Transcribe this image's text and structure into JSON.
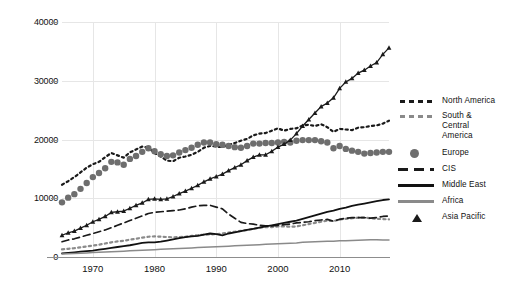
{
  "chart_data": {
    "type": "line",
    "title": "",
    "xlabel": "",
    "ylabel": "",
    "xlim": [
      1965,
      2018
    ],
    "ylim": [
      0,
      40000
    ],
    "grid": true,
    "legend_position": "right",
    "x_ticks": [
      "1970",
      "1980",
      "1990",
      "2000",
      "2010"
    ],
    "x_tick_values": [
      1970,
      1980,
      1990,
      2000,
      2010
    ],
    "y_ticks": [
      "0",
      "10000",
      "20000",
      "30000",
      "40000"
    ],
    "y_tick_values": [
      0,
      10000,
      20000,
      30000,
      40000
    ],
    "x": [
      1965,
      1966,
      1967,
      1968,
      1969,
      1970,
      1971,
      1972,
      1973,
      1974,
      1975,
      1976,
      1977,
      1978,
      1979,
      1980,
      1981,
      1982,
      1983,
      1984,
      1985,
      1986,
      1987,
      1988,
      1989,
      1990,
      1991,
      1992,
      1993,
      1994,
      1995,
      1996,
      1997,
      1998,
      1999,
      2000,
      2001,
      2002,
      2003,
      2004,
      2005,
      2006,
      2007,
      2008,
      2009,
      2010,
      2011,
      2012,
      2013,
      2014,
      2015,
      2016,
      2017,
      2018
    ],
    "series": [
      {
        "name": "North America",
        "style": "square-dotted",
        "color": "#1a1a1a",
        "values": [
          12300,
          12900,
          13600,
          14400,
          15200,
          15800,
          16200,
          17000,
          17700,
          17300,
          16900,
          17800,
          18300,
          18800,
          18600,
          17700,
          17100,
          16400,
          16300,
          16900,
          17100,
          17400,
          17900,
          18600,
          18900,
          18800,
          18700,
          19100,
          19400,
          19800,
          20100,
          20700,
          21000,
          21100,
          21500,
          21900,
          21500,
          21800,
          21900,
          22400,
          22500,
          22300,
          22600,
          22100,
          21300,
          21800,
          21700,
          21600,
          22000,
          22100,
          22300,
          22400,
          22700,
          23200
        ]
      },
      {
        "name": "South & Central America",
        "style": "square-dotted",
        "color": "#8a8a8a",
        "values": [
          1300,
          1400,
          1500,
          1650,
          1800,
          1950,
          2100,
          2300,
          2500,
          2650,
          2750,
          2950,
          3100,
          3300,
          3450,
          3500,
          3450,
          3400,
          3350,
          3400,
          3450,
          3600,
          3700,
          3800,
          3850,
          3900,
          4000,
          4150,
          4300,
          4450,
          4600,
          4800,
          5000,
          5100,
          5100,
          5200,
          5200,
          5150,
          5200,
          5400,
          5600,
          5800,
          6000,
          6200,
          6100,
          6400,
          6500,
          6600,
          6700,
          6700,
          6600,
          6500,
          6450,
          6400
        ]
      },
      {
        "name": "Europe",
        "style": "circle-marker",
        "color": "#6e6e6e",
        "values": [
          9300,
          10100,
          10700,
          11600,
          12600,
          13600,
          14300,
          15100,
          16200,
          16100,
          15700,
          16700,
          17200,
          17900,
          18500,
          18000,
          17500,
          17200,
          17300,
          17800,
          18200,
          18600,
          19100,
          19500,
          19500,
          19200,
          19100,
          18900,
          18700,
          18600,
          18900,
          19300,
          19300,
          19400,
          19400,
          19500,
          19600,
          19500,
          19800,
          19900,
          19900,
          19900,
          19700,
          19500,
          18500,
          18900,
          18400,
          18100,
          17900,
          17600,
          17700,
          17800,
          17900,
          17900
        ]
      },
      {
        "name": "CIS",
        "style": "dashed",
        "color": "#1a1a1a",
        "values": [
          2600,
          2900,
          3100,
          3400,
          3700,
          4000,
          4300,
          4600,
          5000,
          5400,
          5800,
          6200,
          6600,
          7000,
          7400,
          7600,
          7700,
          7800,
          7900,
          8000,
          8200,
          8500,
          8700,
          8800,
          8800,
          8500,
          8200,
          7300,
          6600,
          5900,
          5700,
          5600,
          5400,
          5300,
          5300,
          5400,
          5500,
          5600,
          5800,
          5900,
          6000,
          6200,
          6300,
          6400,
          6100,
          6400,
          6600,
          6700,
          6700,
          6700,
          6600,
          6700,
          6900,
          7000
        ]
      },
      {
        "name": "Middle East",
        "style": "solid",
        "color": "#111111",
        "values": [
          600,
          700,
          800,
          900,
          1000,
          1100,
          1250,
          1400,
          1550,
          1700,
          1850,
          2000,
          2200,
          2400,
          2500,
          2500,
          2600,
          2800,
          3000,
          3200,
          3400,
          3500,
          3600,
          3800,
          4000,
          3900,
          3700,
          4000,
          4200,
          4400,
          4600,
          4800,
          5000,
          5200,
          5400,
          5600,
          5800,
          6000,
          6200,
          6500,
          6800,
          7100,
          7400,
          7700,
          7900,
          8200,
          8400,
          8700,
          8900,
          9100,
          9300,
          9500,
          9700,
          9800
        ]
      },
      {
        "name": "Africa",
        "style": "solid",
        "color": "#8a8a8a",
        "values": [
          500,
          550,
          600,
          650,
          700,
          750,
          800,
          850,
          900,
          950,
          1000,
          1050,
          1100,
          1150,
          1200,
          1250,
          1300,
          1350,
          1400,
          1450,
          1500,
          1550,
          1600,
          1650,
          1700,
          1750,
          1800,
          1850,
          1900,
          1950,
          2000,
          2050,
          2100,
          2150,
          2200,
          2250,
          2300,
          2350,
          2400,
          2500,
          2550,
          2600,
          2650,
          2700,
          2700,
          2750,
          2750,
          2800,
          2850,
          2900,
          2950,
          2950,
          2900,
          2900
        ]
      },
      {
        "name": "Asia Pacific",
        "style": "triangle-marker",
        "color": "#1a1a1a",
        "values": [
          3700,
          4100,
          4400,
          4900,
          5400,
          6000,
          6400,
          6900,
          7600,
          7700,
          7800,
          8300,
          8800,
          9200,
          9800,
          9900,
          9800,
          9900,
          10300,
          10800,
          11200,
          11700,
          12200,
          12800,
          13300,
          13700,
          14100,
          14700,
          15200,
          15700,
          16400,
          17000,
          17400,
          17400,
          18000,
          18700,
          19200,
          19900,
          21000,
          22300,
          23400,
          24500,
          25600,
          26200,
          27100,
          28700,
          29800,
          30400,
          31300,
          31800,
          32500,
          33100,
          34500,
          35600
        ]
      }
    ]
  },
  "legend": {
    "items": [
      {
        "label": "North America",
        "marker": "square-dotted-dark"
      },
      {
        "label": "South & Central America",
        "marker": "square-dotted-grey"
      },
      {
        "label": "Europe",
        "marker": "circle-grey"
      },
      {
        "label": "CIS",
        "marker": "dashed-dark"
      },
      {
        "label": "Middle East",
        "marker": "solid-dark"
      },
      {
        "label": "Africa",
        "marker": "solid-grey"
      },
      {
        "label": "Asia Pacific",
        "marker": "triangle-dark"
      }
    ]
  }
}
